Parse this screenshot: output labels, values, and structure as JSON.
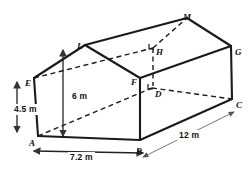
{
  "figure": {
    "stroke_color": "#1a1a1a",
    "hidden_edge_color": "#1a1a1a",
    "dimension_line_color": "#555555",
    "background": "#ffffff"
  },
  "vertices": [
    {
      "id": "vertex-A",
      "label": "A",
      "x": 38,
      "y": 136,
      "lx": 29,
      "ly": 139
    },
    {
      "id": "vertex-B",
      "label": "B",
      "x": 140,
      "y": 140,
      "lx": 136,
      "ly": 147
    },
    {
      "id": "vertex-C",
      "label": "C",
      "x": 232,
      "y": 99,
      "lx": 236,
      "ly": 101
    },
    {
      "id": "vertex-D",
      "label": "D",
      "x": 152,
      "y": 88,
      "lx": 155,
      "ly": 90
    },
    {
      "id": "vertex-E",
      "label": "E",
      "x": 34,
      "y": 78,
      "lx": 25,
      "ly": 79
    },
    {
      "id": "vertex-F",
      "label": "F",
      "x": 140,
      "y": 78,
      "lx": 131,
      "ly": 78
    },
    {
      "id": "vertex-G",
      "label": "G",
      "x": 231,
      "y": 46,
      "lx": 235,
      "ly": 48
    },
    {
      "id": "vertex-H",
      "label": "H",
      "x": 153,
      "y": 48,
      "lx": 156,
      "ly": 48
    },
    {
      "id": "vertex-L",
      "label": "L",
      "x": 85,
      "y": 45,
      "lx": 77,
      "ly": 42
    },
    {
      "id": "vertex-M",
      "label": "M",
      "x": 187,
      "y": 18,
      "lx": 183,
      "ly": 13
    }
  ],
  "solid_edges": [
    {
      "name": "edge-A-B",
      "x1": 38,
      "y1": 136,
      "x2": 140,
      "y2": 140
    },
    {
      "name": "edge-A-E",
      "x1": 38,
      "y1": 136,
      "x2": 34,
      "y2": 78
    },
    {
      "name": "edge-E-L",
      "x1": 34,
      "y1": 78,
      "x2": 85,
      "y2": 45
    },
    {
      "name": "edge-L-F",
      "x1": 85,
      "y1": 45,
      "x2": 140,
      "y2": 78
    },
    {
      "name": "edge-F-B",
      "x1": 140,
      "y1": 78,
      "x2": 140,
      "y2": 140
    },
    {
      "name": "edge-L-M",
      "x1": 85,
      "y1": 45,
      "x2": 187,
      "y2": 18
    },
    {
      "name": "edge-M-G",
      "x1": 187,
      "y1": 18,
      "x2": 231,
      "y2": 46
    },
    {
      "name": "edge-F-G",
      "x1": 140,
      "y1": 78,
      "x2": 231,
      "y2": 46
    },
    {
      "name": "edge-G-C",
      "x1": 231,
      "y1": 46,
      "x2": 232,
      "y2": 99
    },
    {
      "name": "edge-B-C",
      "x1": 140,
      "y1": 140,
      "x2": 232,
      "y2": 99
    }
  ],
  "hidden_edges": [
    {
      "name": "hidden-edge-E-H",
      "x1": 34,
      "y1": 78,
      "x2": 153,
      "y2": 48
    },
    {
      "name": "hidden-edge-H-M",
      "x1": 153,
      "y1": 48,
      "x2": 187,
      "y2": 18
    },
    {
      "name": "hidden-edge-A-D",
      "x1": 38,
      "y1": 136,
      "x2": 152,
      "y2": 88
    },
    {
      "name": "hidden-edge-D-C",
      "x1": 152,
      "y1": 88,
      "x2": 232,
      "y2": 99
    },
    {
      "name": "hidden-edge-H-D",
      "x1": 153,
      "y1": 48,
      "x2": 153,
      "y2": 86
    }
  ],
  "dimensions": [
    {
      "id": "dim-height-wall",
      "label": "4.5 m",
      "lx": 12,
      "ly": 104,
      "x1": 17,
      "y1": 82,
      "x2": 17,
      "y2": 132,
      "orientation": "vertical"
    },
    {
      "id": "dim-height-apex",
      "label": "6 m",
      "lx": 70,
      "ly": 91,
      "x1": 63,
      "y1": 50,
      "x2": 63,
      "y2": 136,
      "orientation": "vertical"
    },
    {
      "id": "dim-width",
      "label": "7.2 m",
      "lx": 68,
      "ly": 152,
      "x1": 34,
      "y1": 151,
      "x2": 143,
      "y2": 153,
      "orientation": "horizontal"
    },
    {
      "id": "dim-depth",
      "label": "12 m",
      "lx": 177,
      "ly": 130,
      "x1": 143,
      "y1": 157,
      "x2": 234,
      "y2": 112,
      "orientation": "diagonal"
    }
  ],
  "right_angle_markers": [
    {
      "id": "right-angle-D",
      "x": 148,
      "y": 84
    },
    {
      "id": "right-angle-H",
      "x": 149,
      "y": 44
    }
  ]
}
